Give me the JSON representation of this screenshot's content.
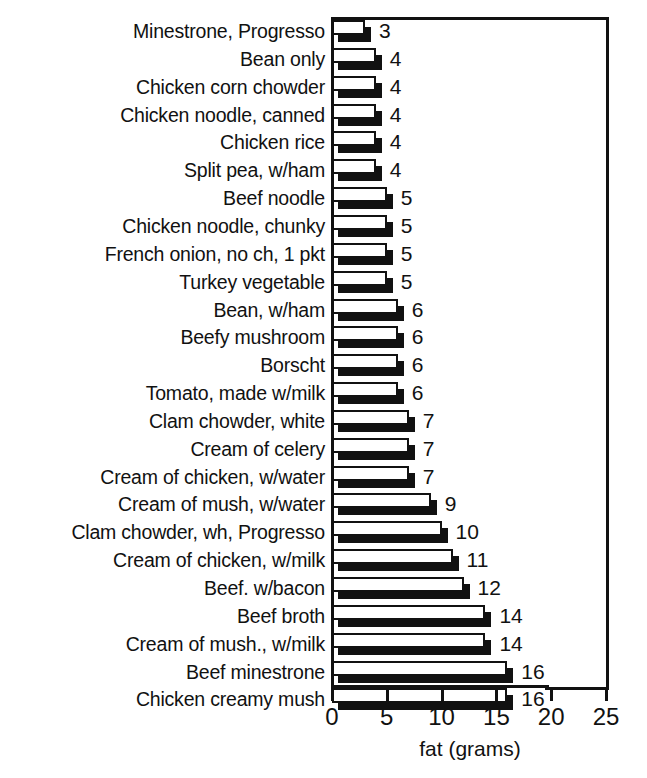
{
  "chart_data": {
    "type": "bar",
    "orientation": "horizontal",
    "title": "",
    "xlabel": "fat (grams)",
    "ylabel": "",
    "xlim": [
      0,
      25
    ],
    "xticks": [
      0,
      5,
      10,
      15,
      20,
      25
    ],
    "xtick_labels": [
      "0",
      "5",
      "10",
      "15",
      "20",
      "25"
    ],
    "grid": false,
    "legend": null,
    "value_labels_shown": true,
    "categories": [
      "Minestrone, Progresso",
      "Bean only",
      "Chicken corn chowder",
      "Chicken noodle, canned",
      "Chicken rice",
      "Split pea, w/ham",
      "Beef noodle",
      "Chicken noodle, chunky",
      "French onion, no ch, 1 pkt",
      "Turkey vegetable",
      "Bean, w/ham",
      "Beefy mushroom",
      "Borscht",
      "Tomato, made w/milk",
      "Clam chowder, white",
      "Cream of celery",
      "Cream of chicken, w/water",
      "Cream of mush, w/water",
      "Clam chowder, wh, Progresso",
      "Cream of chicken, w/milk",
      "Beef. w/bacon",
      "Beef broth",
      "Cream of mush., w/milk",
      "Beef minestrone",
      "Chicken creamy mush"
    ],
    "values": [
      3,
      4,
      4,
      4,
      4,
      4,
      5,
      5,
      5,
      5,
      6,
      6,
      6,
      6,
      7,
      7,
      7,
      9,
      10,
      11,
      12,
      14,
      14,
      16,
      16
    ],
    "value_label_texts": [
      "3",
      "4",
      "4",
      "4",
      "4",
      "4",
      "5",
      "5",
      "5",
      "5",
      "6",
      "6",
      "6",
      "6",
      "7",
      "7",
      "7",
      "9",
      "10",
      "11",
      "12",
      "14",
      "14",
      "16",
      "16"
    ]
  },
  "style": {
    "bar_face_color": "#ffffff",
    "bar_edge_color": "#111111",
    "bar_shadow_color": "#111111",
    "axis_color": "#111111",
    "background_color": "#ffffff"
  }
}
